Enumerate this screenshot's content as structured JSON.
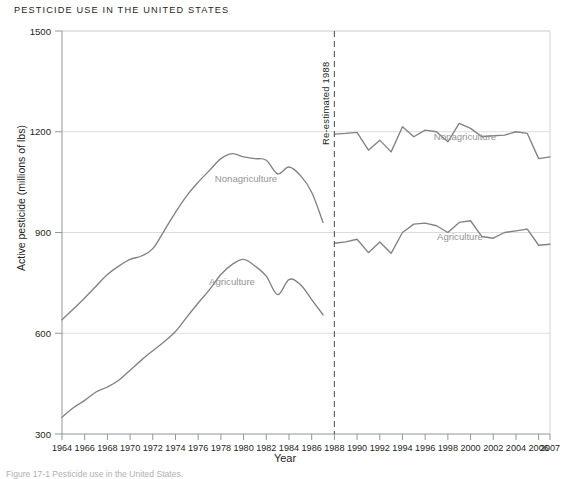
{
  "figure": {
    "title": "PESTICIDE USE IN THE UNITED STATES",
    "caption": "Figure 17-1  Pesticide use in the United States.",
    "colors": {
      "line": "#808285",
      "grid": "#d9dadb",
      "axis": "#939598",
      "text": "#231f20",
      "series_label": "#939598",
      "annotation_line": "#58595b"
    }
  },
  "chart_data": {
    "type": "line",
    "title": "PESTICIDE USE IN THE UNITED STATES",
    "xlabel": "Year",
    "ylabel": "Active pesticide (millions of lbs)",
    "xlim": [
      1964,
      2007
    ],
    "ylim": [
      300,
      1500
    ],
    "yticks": [
      300,
      600,
      900,
      1200,
      1500
    ],
    "xticks": [
      1964,
      1966,
      1968,
      1970,
      1972,
      1974,
      1976,
      1978,
      1980,
      1982,
      1984,
      1986,
      1988,
      1990,
      1992,
      1994,
      1996,
      1998,
      2000,
      2002,
      2004,
      2006,
      2007
    ],
    "grid": "horizontal",
    "legend": "inline-labels",
    "annotations": [
      {
        "text": "Re-estimated 1988",
        "x": 1988,
        "orientation": "vertical",
        "line_style": "dashed"
      }
    ],
    "series": [
      {
        "name": "Nonagriculture",
        "segment": "pre-1988",
        "x": [
          1964,
          1965,
          1966,
          1967,
          1968,
          1969,
          1970,
          1971,
          1972,
          1973,
          1974,
          1975,
          1976,
          1977,
          1978,
          1979,
          1980,
          1981,
          1982,
          1983,
          1984,
          1985,
          1986,
          1987
        ],
        "values": [
          640,
          672,
          705,
          740,
          775,
          800,
          820,
          830,
          852,
          905,
          960,
          1010,
          1050,
          1085,
          1120,
          1135,
          1125,
          1120,
          1115,
          1075,
          1095,
          1070,
          1020,
          930
        ]
      },
      {
        "name": "Nonagriculture",
        "segment": "post-1988",
        "x": [
          1988,
          1989,
          1990,
          1991,
          1992,
          1993,
          1994,
          1995,
          1996,
          1997,
          1998,
          1999,
          2000,
          2001,
          2002,
          2003,
          2004,
          2005,
          2006,
          2007
        ],
        "values": [
          1193,
          1195,
          1198,
          1145,
          1175,
          1140,
          1215,
          1185,
          1205,
          1200,
          1170,
          1225,
          1210,
          1185,
          1188,
          1190,
          1200,
          1195,
          1120,
          1125
        ]
      },
      {
        "name": "Agriculture",
        "segment": "pre-1988",
        "x": [
          1964,
          1965,
          1966,
          1967,
          1968,
          1969,
          1970,
          1971,
          1972,
          1973,
          1974,
          1975,
          1976,
          1977,
          1978,
          1979,
          1980,
          1981,
          1982,
          1983,
          1984,
          1985,
          1986,
          1987
        ],
        "values": [
          350,
          378,
          400,
          425,
          440,
          460,
          490,
          520,
          548,
          575,
          605,
          648,
          690,
          730,
          775,
          805,
          820,
          800,
          770,
          715,
          760,
          745,
          700,
          655
        ]
      },
      {
        "name": "Agriculture",
        "segment": "post-1988",
        "x": [
          1988,
          1989,
          1990,
          1991,
          1992,
          1993,
          1994,
          1995,
          1996,
          1997,
          1998,
          1999,
          2000,
          2001,
          2002,
          2003,
          2004,
          2005,
          2006,
          2007
        ],
        "values": [
          868,
          872,
          880,
          840,
          872,
          838,
          900,
          925,
          928,
          920,
          900,
          930,
          935,
          888,
          883,
          900,
          905,
          910,
          862,
          865
        ]
      }
    ],
    "series_labels": [
      {
        "text": "Nonagriculture",
        "x": 246,
        "y": 182
      },
      {
        "text": "Agriculture",
        "x": 232,
        "y": 285
      },
      {
        "text": "Nonagriculture",
        "x": 465,
        "y": 140
      },
      {
        "text": "Agriculture",
        "x": 460,
        "y": 240
      }
    ]
  }
}
